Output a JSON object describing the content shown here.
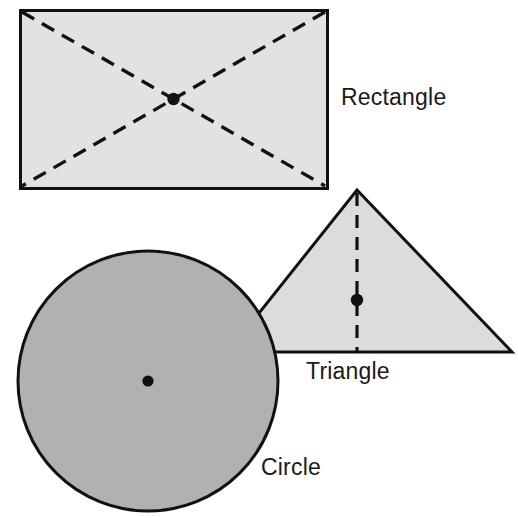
{
  "figure": {
    "kind": "geometry-centroid-diagram",
    "background_color": "#ffffff",
    "outline_color": "#111111",
    "dash_color": "#111111",
    "centroid_dot_color": "#111111"
  },
  "labels": {
    "rectangle": "Rectangle",
    "triangle": "Triangle",
    "circle": "Circle"
  },
  "chart_data": {
    "type": "diagram",
    "title": "",
    "shapes": [
      {
        "name": "rectangle",
        "label": "Rectangle",
        "fill": "#e2e2e2",
        "stroke": "#111111",
        "stroke_width": 3,
        "x": 20,
        "y": 10,
        "width": 307,
        "height": 178,
        "centroid": {
          "x": 173.5,
          "y": 99
        },
        "construction_lines": [
          {
            "kind": "dashed-diagonal",
            "from": {
              "x": 20,
              "y": 10
            },
            "to": {
              "x": 327,
              "y": 188
            }
          },
          {
            "kind": "dashed-diagonal",
            "from": {
              "x": 327,
              "y": 10
            },
            "to": {
              "x": 20,
              "y": 188
            }
          }
        ],
        "label_position": {
          "x": 341,
          "y": 99
        }
      },
      {
        "name": "triangle",
        "label": "Triangle",
        "fill": "#dcdcdc",
        "stroke": "#111111",
        "stroke_width": 3,
        "vertices": [
          {
            "x": 357,
            "y": 190
          },
          {
            "x": 512,
            "y": 352
          },
          {
            "x": 228,
            "y": 352
          }
        ],
        "centroid": {
          "x": 357,
          "y": 300
        },
        "construction_lines": [
          {
            "kind": "dashed-median",
            "from": {
              "x": 357,
              "y": 190
            },
            "to": {
              "x": 357,
              "y": 352
            }
          }
        ],
        "label_position": {
          "x": 306,
          "y": 375
        }
      },
      {
        "name": "circle",
        "label": "Circle",
        "fill": "#b1b1b1",
        "stroke": "#111111",
        "stroke_width": 3,
        "center": {
          "x": 148,
          "y": 381
        },
        "radius": 131,
        "centroid": {
          "x": 148,
          "y": 381
        },
        "construction_lines": [],
        "label_position": {
          "x": 261,
          "y": 470
        }
      }
    ],
    "draw_order": [
      "rectangle",
      "triangle",
      "circle"
    ]
  }
}
